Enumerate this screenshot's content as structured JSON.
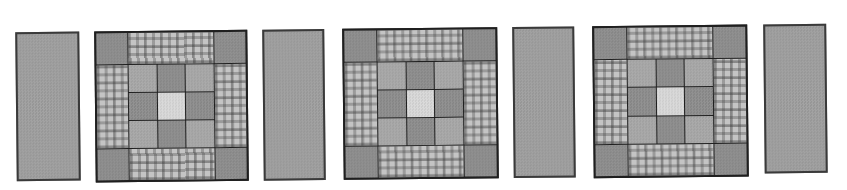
{
  "canvas": {
    "width": 847,
    "height": 190,
    "background": "#ffffff"
  },
  "palette": {
    "canvas_bg": "#ffffff",
    "seam": "#1f1f1f",
    "sashing": "#9e9e9e",
    "patch_dark": "#8c8c8c",
    "patch_medium": "#a7a7a7",
    "patch_light": "#d8d8d8",
    "print_base": "#c4c4c4",
    "print_motif": "#5a5a5a"
  },
  "row": {
    "items": [
      {
        "type": "sashing-strip"
      },
      {
        "type": "quilt-block"
      },
      {
        "type": "sashing-strip"
      },
      {
        "type": "quilt-block"
      },
      {
        "type": "sashing-strip"
      },
      {
        "type": "quilt-block"
      },
      {
        "type": "sashing-strip"
      }
    ]
  },
  "quilt_block": {
    "corner_fill": "dark",
    "border_strip_pattern": "gingham-print",
    "border_strips": [
      "top",
      "right",
      "bottom",
      "left"
    ],
    "inner_grid": [
      [
        "medium",
        "dark",
        "medium"
      ],
      [
        "dark",
        "light",
        "dark"
      ],
      [
        "medium",
        "dark",
        "medium"
      ]
    ]
  }
}
